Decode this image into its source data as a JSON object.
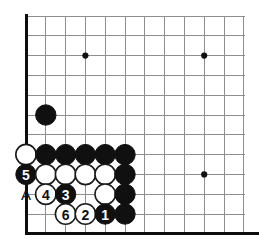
{
  "figure": {
    "width": 259,
    "height": 250
  },
  "board": {
    "type": "go-board-corner",
    "origin_x": 26,
    "origin_y": 16,
    "cell": 19.8,
    "cols": 12,
    "rows": 11,
    "stone_radius": 10.2,
    "line_color": "#8e8e8e",
    "edge_color": "#0d0d0d",
    "black_color": "#101010",
    "white_color": "#ffffff",
    "background": "#ffffff",
    "star_points": [
      {
        "col": 3,
        "row": 2
      },
      {
        "col": 9,
        "row": 2
      },
      {
        "col": 9,
        "row": 8
      }
    ],
    "edges": {
      "left": true,
      "bottom": true,
      "top": false,
      "right": false
    }
  },
  "stones": [
    {
      "col": 1,
      "row": 5,
      "color": "black",
      "label": ""
    },
    {
      "col": 0,
      "row": 7,
      "color": "white",
      "label": ""
    },
    {
      "col": 1,
      "row": 7,
      "color": "black",
      "label": ""
    },
    {
      "col": 2,
      "row": 7,
      "color": "black",
      "label": ""
    },
    {
      "col": 3,
      "row": 7,
      "color": "black",
      "label": ""
    },
    {
      "col": 4,
      "row": 7,
      "color": "black",
      "label": ""
    },
    {
      "col": 5,
      "row": 7,
      "color": "black",
      "label": ""
    },
    {
      "col": 0,
      "row": 8,
      "color": "black",
      "label": "5"
    },
    {
      "col": 1,
      "row": 8,
      "color": "white",
      "label": ""
    },
    {
      "col": 2,
      "row": 8,
      "color": "white",
      "label": ""
    },
    {
      "col": 3,
      "row": 8,
      "color": "white",
      "label": ""
    },
    {
      "col": 4,
      "row": 8,
      "color": "white",
      "label": ""
    },
    {
      "col": 5,
      "row": 8,
      "color": "black",
      "label": ""
    },
    {
      "col": 1,
      "row": 9,
      "color": "white",
      "label": "4"
    },
    {
      "col": 2,
      "row": 9,
      "color": "black",
      "label": "3"
    },
    {
      "col": 4,
      "row": 9,
      "color": "white",
      "label": ""
    },
    {
      "col": 5,
      "row": 9,
      "color": "black",
      "label": ""
    },
    {
      "col": 2,
      "row": 10,
      "color": "white",
      "label": "6"
    },
    {
      "col": 3,
      "row": 10,
      "color": "white",
      "label": "2"
    },
    {
      "col": 4,
      "row": 10,
      "color": "black",
      "label": "1"
    },
    {
      "col": 5,
      "row": 10,
      "color": "black",
      "label": ""
    }
  ],
  "point_markers": [
    {
      "col": 0,
      "row": 9,
      "text": "A"
    }
  ],
  "move_sequence": [
    {
      "number": "1",
      "color": "black"
    },
    {
      "number": "2",
      "color": "white"
    },
    {
      "number": "3",
      "color": "black"
    },
    {
      "number": "4",
      "color": "white"
    },
    {
      "number": "5",
      "color": "black"
    },
    {
      "number": "6",
      "color": "white"
    }
  ]
}
